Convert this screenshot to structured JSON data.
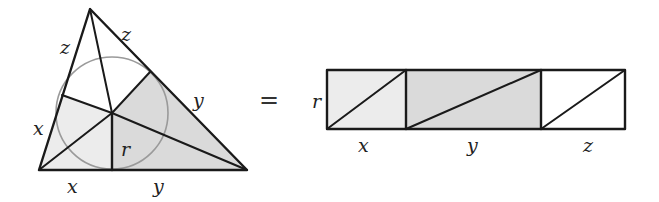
{
  "diagram": {
    "colors": {
      "line": "#1a1a1a",
      "circle": "#9a9a9a",
      "light_shade": "#ececec",
      "medium_shade": "#dadada",
      "white": "#ffffff"
    },
    "triangle": {
      "vertices": {
        "top": [
          90,
          9
        ],
        "bottom_left": [
          39,
          170
        ],
        "bottom_right": [
          247,
          170
        ]
      },
      "incenter": [
        112,
        113
      ],
      "inradius": 56,
      "tangent_points": {
        "left": [
          62,
          95
        ],
        "right": [
          150,
          72
        ],
        "base": [
          112,
          170
        ]
      },
      "labels": {
        "left_upper": "z",
        "right_upper": "z",
        "left_lower": "x",
        "right_lower": "y",
        "base_left": "x",
        "base_right": "y",
        "radius": "r"
      }
    },
    "equals": "=",
    "rectangles": {
      "height_label": "r",
      "segments": [
        {
          "label": "x",
          "shade": "light"
        },
        {
          "label": "y",
          "shade": "medium"
        },
        {
          "label": "z",
          "shade": "white"
        }
      ]
    }
  }
}
